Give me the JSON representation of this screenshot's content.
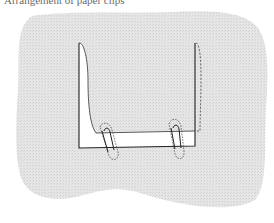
{
  "caption": "Arrangement of paper clips",
  "colors": {
    "background": "#ffffff",
    "blob_fill": "#e3e3e3",
    "paper_fill": "#ffffff",
    "outline": "#222222",
    "dashed_outline": "#555555"
  },
  "diagram": {
    "elements": [
      {
        "name": "background-blob",
        "type": "shape"
      },
      {
        "name": "folded-paper-strip",
        "type": "shape"
      },
      {
        "name": "paper-clip-left",
        "type": "icon"
      },
      {
        "name": "paper-clip-right",
        "type": "icon"
      },
      {
        "name": "dashed-fold-right",
        "type": "line"
      }
    ]
  }
}
